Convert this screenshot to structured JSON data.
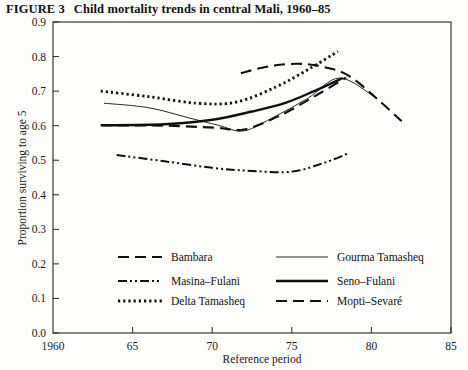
{
  "figure": {
    "label": "FIGURE 3",
    "title": "Child mortality trends in central Mali, 1960–85"
  },
  "chart_data": {
    "type": "line",
    "title": "Child mortality trends in central Mali, 1960–85",
    "xlabel": "Reference period",
    "ylabel": "Proportion surviving to age 5",
    "xlim": [
      1960,
      1985
    ],
    "ylim": [
      0.0,
      0.9
    ],
    "grid": false,
    "legend_position": "inside-bottom",
    "xticks": [
      1960,
      65,
      70,
      75,
      80,
      85
    ],
    "xtick_labels": [
      "1960",
      "65",
      "70",
      "75",
      "80",
      "85"
    ],
    "yticks": [
      0.0,
      0.1,
      0.2,
      0.3,
      0.4,
      0.5,
      0.6,
      0.7,
      0.8,
      0.9
    ],
    "ytick_labels": [
      "0.0",
      "0.1",
      "0.2",
      "0.3",
      "0.4",
      "0.5",
      "0.6",
      "0.7",
      "0.8",
      "0.9"
    ],
    "series": [
      {
        "name": "Bambara",
        "style": "dashed",
        "dash": "11,6",
        "width": 2.1,
        "x": [
          1963.0,
          1967.0,
          1970.2,
          1972.0,
          1974.2,
          1976.4,
          1978.4
        ],
        "values": [
          0.601,
          0.6,
          0.594,
          0.589,
          0.628,
          0.684,
          0.739
        ]
      },
      {
        "name": "Masina–Fulani",
        "style": "dash-dot-dot",
        "dash": "9,3,2,3,2,3",
        "width": 2.0,
        "x": [
          1964.0,
          1967.0,
          1970.0,
          1972.5,
          1975.0,
          1977.0,
          1978.6
        ],
        "values": [
          0.515,
          0.497,
          0.478,
          0.469,
          0.467,
          0.492,
          0.521
        ]
      },
      {
        "name": "Delta Tamasheq",
        "style": "dotted",
        "dash": "2.2,3.0",
        "width": 2.8,
        "x": [
          1963.0,
          1966.0,
          1969.0,
          1971.5,
          1974.0,
          1976.0,
          1977.9
        ],
        "values": [
          0.7,
          0.684,
          0.665,
          0.668,
          0.712,
          0.762,
          0.815
        ]
      },
      {
        "name": "Gourma Tamasheq",
        "style": "solid-thin",
        "dash": "none",
        "width": 0.9,
        "x": [
          1963.2,
          1966.0,
          1968.5,
          1970.4,
          1972.0,
          1974.0,
          1976.0,
          1978.0,
          1980.2
        ],
        "values": [
          0.665,
          0.652,
          0.623,
          0.601,
          0.585,
          0.628,
          0.679,
          0.738,
          0.683
        ]
      },
      {
        "name": "Seno–Fulani",
        "style": "solid-thick",
        "dash": "none",
        "width": 2.4,
        "x": [
          1963.0,
          1967.0,
          1970.0,
          1972.5,
          1974.6,
          1976.4,
          1978.2
        ],
        "values": [
          0.601,
          0.604,
          0.617,
          0.641,
          0.666,
          0.7,
          0.738
        ]
      },
      {
        "name": "Mopti–Sevaré",
        "style": "dashed",
        "dash": "11,6",
        "width": 2.1,
        "x": [
          1971.8,
          1973.6,
          1975.4,
          1977.0,
          1978.6,
          1980.4,
          1981.9
        ],
        "values": [
          0.752,
          0.772,
          0.779,
          0.77,
          0.744,
          0.676,
          0.613
        ]
      }
    ]
  },
  "legend": {
    "entries": [
      {
        "label": "Bambara",
        "series": "Bambara"
      },
      {
        "label": "Masina–Fulani",
        "series": "Masina–Fulani"
      },
      {
        "label": "Delta Tamasheq",
        "series": "Delta Tamasheq"
      },
      {
        "label": "Gourma Tamasheq",
        "series": "Gourma Tamasheq"
      },
      {
        "label": "Seno–Fulani",
        "series": "Seno–Fulani"
      },
      {
        "label": "Mopti–Sevaré",
        "series": "Mopti–Sevaré"
      }
    ]
  },
  "colors": {
    "ink": "#101010",
    "axis": "#262626",
    "page": "#fdfdfc"
  }
}
